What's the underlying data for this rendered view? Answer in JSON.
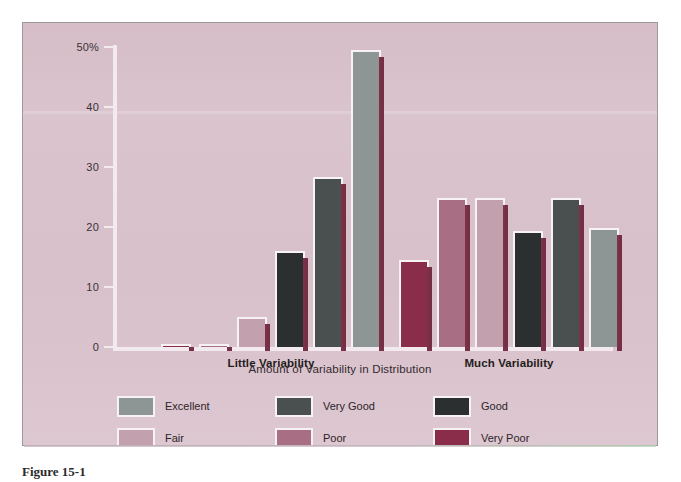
{
  "figure": {
    "caption": "Figure 15-1"
  },
  "chart_data": {
    "type": "bar",
    "title": "",
    "xlabel": "Amount of Variability in Distribution",
    "ylabel": "",
    "categories": [
      "Little Variability",
      "Much Variability"
    ],
    "ylim": [
      0,
      50
    ],
    "yticks": [
      0,
      10,
      20,
      30,
      40,
      50
    ],
    "ytick_labels": [
      "0",
      "10",
      "20",
      "30",
      "40",
      "50%"
    ],
    "grid": false,
    "legend_position": "bottom",
    "series": [
      {
        "name": "Excellent",
        "color": "#8d9595",
        "values": [
          49.5,
          19.8
        ]
      },
      {
        "name": "Very Good",
        "color": "#4a4f4f",
        "values": [
          28.3,
          24.9
        ]
      },
      {
        "name": "Good",
        "color": "#2b2f2f",
        "values": [
          16.0,
          19.3
        ]
      },
      {
        "name": "Fair",
        "color": "#c3a0ae",
        "values": [
          5.0,
          24.9
        ]
      },
      {
        "name": "Poor",
        "color": "#a86f84",
        "values": [
          0.3,
          24.9
        ]
      },
      {
        "name": "Very Poor",
        "color": "#8a2d4a",
        "values": [
          0.3,
          14.5
        ]
      }
    ],
    "group_bar_order": [
      [
        "Very Poor",
        "Poor",
        "Fair",
        "Good",
        "Very Good",
        "Excellent"
      ],
      [
        "Very Poor",
        "Poor",
        "Fair",
        "Good",
        "Very Good",
        "Excellent"
      ]
    ],
    "bars": [
      {
        "group": "Little Variability",
        "series": "Very Poor",
        "value": 0.3,
        "color": "#8a2d4a",
        "x": 48,
        "w": 30
      },
      {
        "group": "Little Variability",
        "series": "Poor",
        "value": 0.3,
        "color": "#a86f84",
        "x": 86,
        "w": 30
      },
      {
        "group": "Little Variability",
        "series": "Fair",
        "value": 5.0,
        "color": "#c3a0ae",
        "x": 124,
        "w": 30
      },
      {
        "group": "Little Variability",
        "series": "Good",
        "value": 16.0,
        "color": "#2b2f2f",
        "x": 162,
        "w": 30
      },
      {
        "group": "Little Variability",
        "series": "Very Good",
        "value": 28.3,
        "color": "#4a4f4f",
        "x": 200,
        "w": 30
      },
      {
        "group": "Little Variability",
        "series": "Excellent",
        "value": 49.5,
        "color": "#8d9595",
        "x": 238,
        "w": 30
      },
      {
        "group": "Much Variability",
        "series": "Very Poor",
        "value": 14.5,
        "color": "#8a2d4a",
        "x": 286,
        "w": 30
      },
      {
        "group": "Much Variability",
        "series": "Poor",
        "value": 24.9,
        "color": "#a86f84",
        "x": 324,
        "w": 30
      },
      {
        "group": "Much Variability",
        "series": "Fair",
        "value": 24.9,
        "color": "#c3a0ae",
        "x": 362,
        "w": 30
      },
      {
        "group": "Much Variability",
        "series": "Good",
        "value": 19.3,
        "color": "#2b2f2f",
        "x": 400,
        "w": 30
      },
      {
        "group": "Much Variability",
        "series": "Very Good",
        "value": 24.9,
        "color": "#4a4f4f",
        "x": 438,
        "w": 30
      },
      {
        "group": "Much Variability",
        "series": "Excellent",
        "value": 19.8,
        "color": "#8d9595",
        "x": 476,
        "w": 30
      }
    ],
    "group_label_positions": [
      158,
      396
    ]
  },
  "legend": {
    "items": [
      {
        "label": "Excellent",
        "color": "#8d9595"
      },
      {
        "label": "Very Good",
        "color": "#4a4f4f"
      },
      {
        "label": "Good",
        "color": "#2b2f2f"
      },
      {
        "label": "Fair",
        "color": "#c3a0ae"
      },
      {
        "label": "Poor",
        "color": "#a86f84"
      },
      {
        "label": "Very Poor",
        "color": "#8a2d4a"
      }
    ]
  },
  "theme": {
    "panel_background": "#d9c3cc",
    "page_background": "#ffffff",
    "axis_color": "#f2eaee",
    "text_color": "#2d2428",
    "shadow_color": "#6e2238"
  }
}
